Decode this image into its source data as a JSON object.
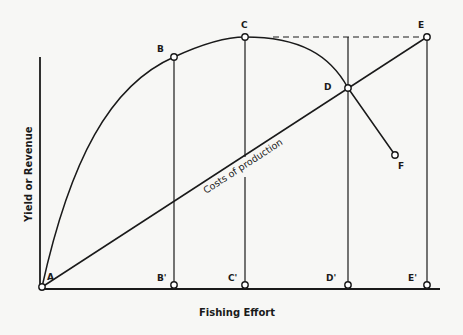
{
  "axes": {
    "x_label": "Fishing Effort",
    "y_label": "Yield or Revenue"
  },
  "curves": {
    "yield_curve": "Yield curve A–B–C–D–F",
    "cost_line": "Costs of production"
  },
  "points": {
    "A": "A",
    "B": "B",
    "C": "C",
    "D": "D",
    "E": "E",
    "F": "F",
    "B_prime": "B'",
    "C_prime": "C'",
    "D_prime": "D'",
    "E_prime": "E'"
  },
  "colors": {
    "ink": "#1a1a1a",
    "background": "#f7f7f5"
  }
}
